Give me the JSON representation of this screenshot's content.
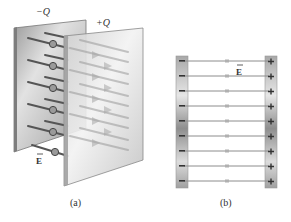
{
  "figure": {
    "panel_a": {
      "caption": "(a)",
      "negative_plate_label": "−Q",
      "positive_plate_label": "+Q",
      "field_label": "E",
      "field_lines": 6
    },
    "panel_b": {
      "caption": "(b)",
      "field_label": "E",
      "negative_sign": "−",
      "positive_sign": "+",
      "field_line_y": [
        61,
        76,
        91,
        106,
        121,
        136,
        151,
        166,
        181
      ]
    },
    "colors": {
      "plate_dark": "#8a8a8a",
      "plate_light": "#e6e6e6",
      "field_line": "#8c8c8c",
      "field_line_a": "#5a5a5a",
      "text": "#333333"
    }
  }
}
